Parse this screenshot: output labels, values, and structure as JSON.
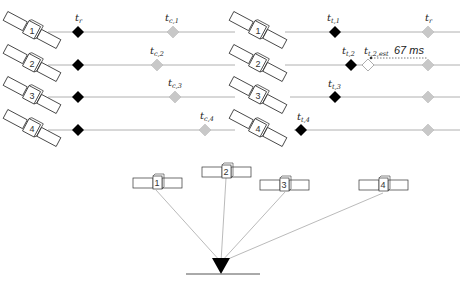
{
  "colors": {
    "timeline": "#b0b0b0",
    "transmit_marker": "#000000",
    "receive_marker": "#c8c8c8",
    "estimate_marker": "#ffffff",
    "signal_line": "#a8a8a8",
    "receiver": "#000000"
  },
  "left_panel": {
    "top_label_t": "t",
    "top_label_sub": "r",
    "rows": [
      {
        "satellite": "1",
        "label_t": "t",
        "label_sub": "c,1"
      },
      {
        "satellite": "2",
        "label_t": "t",
        "label_sub": "c,2"
      },
      {
        "satellite": "3",
        "label_t": "t",
        "label_sub": "c,3"
      },
      {
        "satellite": "4",
        "label_t": "t",
        "label_sub": "c,4"
      }
    ]
  },
  "right_panel": {
    "top_label_t": "t",
    "top_label_sub": "r",
    "rows": [
      {
        "satellite": "1",
        "label_t": "t",
        "label_sub": "t,1"
      },
      {
        "satellite": "2",
        "label_t": "t",
        "label_sub": "t,2",
        "est_label_t": "t",
        "est_label_sub": "t,2,est",
        "offset_label": "67 ms"
      },
      {
        "satellite": "3",
        "label_t": "t",
        "label_sub": "t,3"
      },
      {
        "satellite": "4",
        "label_t": "t",
        "label_sub": "t,4"
      }
    ]
  },
  "bottom_panel": {
    "satellites": [
      "1",
      "2",
      "3",
      "4"
    ]
  }
}
